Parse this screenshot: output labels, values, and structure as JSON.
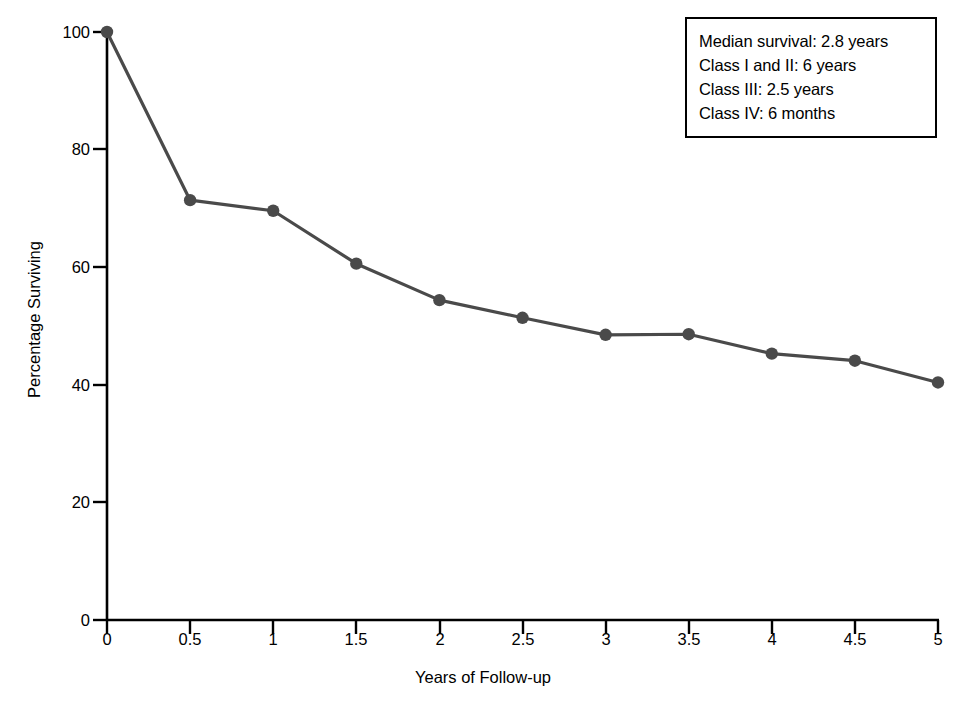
{
  "chart_data": {
    "type": "line",
    "title": "",
    "xlabel": "Years of Follow-up",
    "ylabel": "Percentage Surviving",
    "xlim": [
      0,
      5
    ],
    "ylim": [
      0,
      100
    ],
    "xticks": [
      "0",
      "0.5",
      "1",
      "1.5",
      "2",
      "2.5",
      "3",
      "3.5",
      "4",
      "4.5",
      "5"
    ],
    "xtick_values": [
      0,
      0.5,
      1,
      1.5,
      2,
      2.5,
      3,
      3.5,
      4,
      4.5,
      5
    ],
    "yticks": [
      "0",
      "20",
      "40",
      "60",
      "80",
      "100"
    ],
    "ytick_values": [
      0,
      20,
      40,
      60,
      80,
      100
    ],
    "grid": false,
    "legend": "none",
    "series": [
      {
        "name": "Percentage Surviving",
        "color": "#4a4a4a",
        "marker": "circle",
        "x": [
          0,
          0.5,
          1,
          1.5,
          2,
          2.5,
          3,
          3.5,
          4,
          4.5,
          5
        ],
        "values": [
          100,
          71.4,
          69.6,
          60.6,
          54.4,
          51.4,
          48.5,
          48.6,
          45.3,
          44.1,
          40.4
        ]
      }
    ],
    "annotations": [
      "Median survival: 2.8 years",
      "Class I and II: 6 years",
      "Class III: 2.5 years",
      "Class IV: 6 months"
    ]
  },
  "annotation_box": {
    "line_0": "Median survival: 2.8 years",
    "line_1": "Class I and II: 6 years",
    "line_2": "Class III: 2.5 years",
    "line_3": "Class IV: 6 months"
  },
  "axes": {
    "x_title": "Years of Follow-up",
    "y_title": "Percentage Surviving",
    "x_ticks": [
      "0",
      "0.5",
      "1",
      "1.5",
      "2",
      "2.5",
      "3",
      "3.5",
      "4",
      "4.5",
      "5"
    ],
    "y_ticks": [
      "0",
      "20",
      "40",
      "60",
      "80",
      "100"
    ]
  },
  "colors": {
    "line": "#4a4a4a",
    "marker": "#4a4a4a",
    "axis": "#000000",
    "text": "#000000",
    "background": "#ffffff",
    "box_border": "#000000"
  }
}
